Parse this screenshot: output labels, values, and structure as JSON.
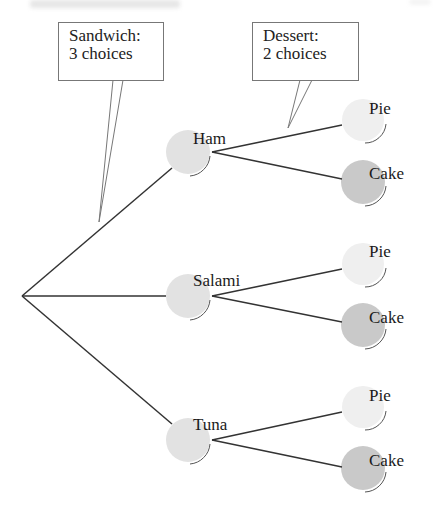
{
  "diagram": {
    "type": "tree",
    "callouts": [
      {
        "id": "sandwich",
        "line1": "Sandwich:",
        "line2": "3 choices"
      },
      {
        "id": "dessert",
        "line1": "Dessert:",
        "line2": "2 choices"
      }
    ],
    "root": {
      "label": ""
    },
    "level1": [
      {
        "label": "Ham",
        "children": [
          {
            "label": "Pie"
          },
          {
            "label": "Cake"
          }
        ]
      },
      {
        "label": "Salami",
        "children": [
          {
            "label": "Pie"
          },
          {
            "label": "Cake"
          }
        ]
      },
      {
        "label": "Tuna",
        "children": [
          {
            "label": "Pie"
          },
          {
            "label": "Cake"
          }
        ]
      }
    ]
  },
  "colors": {
    "sandwich_node": "#e2e2e2",
    "pie_node": "#efefef",
    "cake_node": "#c9c9c9",
    "edge": "#333333",
    "callout_border": "#777777"
  }
}
